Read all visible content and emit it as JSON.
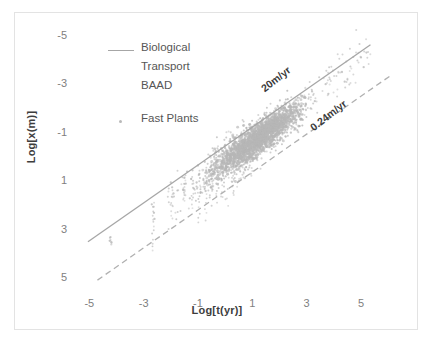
{
  "chart_data": {
    "type": "scatter",
    "title": "",
    "xlabel": "Log[t(yr)]",
    "ylabel": "Log[x(m)]",
    "xlim": [
      -5.6,
      6.4
    ],
    "ylim": [
      -5.6,
      5.6
    ],
    "xticks": [
      -5,
      -3,
      -1,
      1,
      3,
      5
    ],
    "yticks": [
      -5,
      -3,
      -1,
      1,
      3,
      5
    ],
    "grid": false,
    "legend_position": "upper-left-inside",
    "legend": [
      {
        "label": "Biological Transport BAAD",
        "label_lines": [
          "Biological",
          "Transport",
          "BAAD"
        ],
        "marker": "line",
        "color": "#a6a6a6"
      },
      {
        "label": "Fast Plants",
        "label_lines": [
          "Fast Plants"
        ],
        "marker": "dot",
        "color": "#b9b9b9"
      }
    ],
    "annotations": [
      {
        "text": "20m/yr",
        "x": 1.5,
        "y": 3.1,
        "rotation": -38,
        "color": "#3a3a3a"
      },
      {
        "text": "0.24m/yr",
        "x": 3.3,
        "y": 1.5,
        "rotation": -38,
        "color": "#3a3a3a"
      }
    ],
    "reference_lines": [
      {
        "name": "20m/yr",
        "style": "solid",
        "color": "#a6a6a6",
        "slope": 0.78,
        "intercept": 0.45,
        "x_start": -5.05,
        "y_start": -3.49,
        "x_end": 5.35,
        "y_end": 4.62
      },
      {
        "name": "0.24m/yr",
        "style": "dashed",
        "color": "#b0b0b0",
        "slope": 0.78,
        "intercept": -1.4,
        "x_start": -4.7,
        "y_start": -5.07,
        "x_end": 6.1,
        "y_end": 3.36
      }
    ],
    "series": [
      {
        "name": "Fast Plants",
        "color": "#b7b7b7",
        "marker": "dot",
        "description": "Dense gray point cloud of plant growth data following a log-log power law; heaviest concentration between Log[t] 0 to 2.5 and Log[x] 0.5 to 2.",
        "n_points_approx": 2600,
        "cluster_center": [
          1.3,
          1.2
        ],
        "x_range": [
          -4.2,
          5.3
        ],
        "y_range": [
          -3.6,
          4.3
        ],
        "points": [
          [
            -4.25,
            -3.45
          ],
          [
            -4.18,
            -3.52
          ],
          [
            -4.22,
            -3.3
          ],
          [
            -2.65,
            -2.05
          ],
          [
            -2.62,
            -2.3
          ],
          [
            -2.7,
            -1.95
          ],
          [
            -2.6,
            -2.55
          ],
          [
            -1.95,
            -1.25
          ],
          [
            -1.9,
            -1.5
          ],
          [
            -2.0,
            -1.05
          ],
          [
            -1.5,
            -0.85
          ],
          [
            -1.45,
            -1.1
          ],
          [
            -1.55,
            -1.35
          ],
          [
            -1.4,
            -0.6
          ],
          [
            -1.2,
            -0.55
          ],
          [
            -1.25,
            -0.9
          ],
          [
            -1.15,
            -1.3
          ],
          [
            -1.3,
            -1.7
          ],
          [
            -1.0,
            -0.35
          ],
          [
            -0.95,
            -0.7
          ],
          [
            -1.05,
            -1.05
          ],
          [
            -0.9,
            -1.45
          ],
          [
            -0.75,
            -0.2
          ],
          [
            -0.7,
            -0.55
          ],
          [
            -0.8,
            -0.95
          ],
          [
            -0.72,
            -1.4
          ],
          [
            -0.55,
            0.05
          ],
          [
            -0.5,
            -0.35
          ],
          [
            -0.6,
            -0.8
          ],
          [
            -0.52,
            -1.25
          ],
          [
            -0.35,
            0.2
          ],
          [
            -0.3,
            -0.15
          ],
          [
            -0.4,
            -0.6
          ],
          [
            -0.32,
            -1.1
          ],
          [
            -0.15,
            0.35
          ],
          [
            -0.1,
            0.0
          ],
          [
            -0.2,
            -0.45
          ],
          [
            -0.12,
            -0.95
          ],
          [
            0.0,
            0.5
          ],
          [
            0.05,
            0.15
          ],
          [
            -0.05,
            -0.3
          ],
          [
            0.02,
            -0.8
          ],
          [
            0.2,
            0.65
          ],
          [
            0.25,
            0.3
          ],
          [
            0.15,
            -0.15
          ],
          [
            0.22,
            -0.65
          ],
          [
            0.4,
            0.8
          ],
          [
            0.45,
            0.45
          ],
          [
            0.35,
            0.0
          ],
          [
            0.42,
            -0.5
          ],
          [
            0.6,
            0.95
          ],
          [
            0.65,
            0.6
          ],
          [
            0.55,
            0.15
          ],
          [
            0.62,
            -0.35
          ],
          [
            0.8,
            1.1
          ],
          [
            0.85,
            0.75
          ],
          [
            0.75,
            0.3
          ],
          [
            0.82,
            -0.2
          ],
          [
            1.0,
            1.25
          ],
          [
            1.05,
            0.9
          ],
          [
            0.95,
            0.45
          ],
          [
            1.02,
            -0.05
          ],
          [
            1.2,
            1.4
          ],
          [
            1.25,
            1.05
          ],
          [
            1.15,
            0.6
          ],
          [
            1.22,
            0.1
          ],
          [
            1.4,
            1.55
          ],
          [
            1.45,
            1.2
          ],
          [
            1.35,
            0.75
          ],
          [
            1.42,
            0.25
          ],
          [
            1.6,
            1.7
          ],
          [
            1.65,
            1.35
          ],
          [
            1.55,
            0.9
          ],
          [
            1.62,
            0.4
          ],
          [
            1.8,
            1.8
          ],
          [
            1.85,
            1.5
          ],
          [
            1.75,
            1.05
          ],
          [
            1.82,
            0.55
          ],
          [
            2.0,
            1.9
          ],
          [
            2.05,
            1.6
          ],
          [
            1.95,
            1.2
          ],
          [
            2.02,
            0.7
          ],
          [
            2.2,
            2.0
          ],
          [
            2.25,
            1.7
          ],
          [
            2.15,
            1.3
          ],
          [
            2.22,
            0.85
          ],
          [
            2.4,
            2.1
          ],
          [
            2.45,
            1.8
          ],
          [
            2.35,
            1.45
          ],
          [
            2.42,
            1.0
          ],
          [
            2.6,
            2.2
          ],
          [
            2.65,
            1.9
          ],
          [
            2.55,
            1.55
          ],
          [
            2.9,
            2.45
          ],
          [
            2.95,
            2.1
          ],
          [
            2.85,
            1.75
          ],
          [
            3.2,
            2.7
          ],
          [
            3.3,
            2.3
          ],
          [
            3.15,
            2.0
          ],
          [
            3.7,
            3.0
          ],
          [
            3.8,
            2.6
          ],
          [
            4.3,
            3.5
          ],
          [
            4.4,
            3.1
          ],
          [
            5.0,
            4.1
          ],
          [
            5.2,
            4.3
          ],
          [
            5.1,
            3.7
          ]
        ]
      }
    ]
  },
  "axis": {
    "ylabel": "Log[x(m)]",
    "xlabel": "Log[t(yr)]",
    "yticks": [
      "5",
      "3",
      "1",
      "-1",
      "-3",
      "-5"
    ],
    "xticks": [
      "-5",
      "-3",
      "-1",
      "1",
      "3",
      "5"
    ]
  },
  "legend": {
    "entry1_line1": "Biological",
    "entry1_line2": "Transport",
    "entry1_line3": "BAAD",
    "entry2_line1": "Fast Plants"
  },
  "annotations": {
    "upper_line": "20m/yr",
    "lower_line": "0.24m/yr"
  }
}
